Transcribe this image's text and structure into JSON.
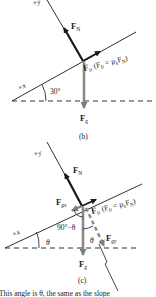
{
  "diagram_b": {
    "axis_y_label": "+y",
    "axis_x_label": "+x",
    "angle_label": "30°",
    "normal_force": {
      "symbol": "F",
      "sub": "N"
    },
    "friction_force": {
      "symbol": "F",
      "sub": "fr",
      "equation_open": "(F",
      "equation_sub": "fr",
      "equation_mid": " = μ",
      "equation_sub2": "k",
      "equation_F": "F",
      "equation_sub3": "N",
      "equation_close": ")"
    },
    "gravity_force": {
      "symbol": "F",
      "sub": "g"
    },
    "caption": "(b)"
  },
  "diagram_c": {
    "axis_y_label": "+y",
    "axis_x_label": "+x",
    "angle_incline_label": "θ",
    "angle_complement_label": "90°−θ",
    "angle_between_label": "θ",
    "normal_force": {
      "symbol": "F",
      "sub": "N"
    },
    "gravity_x": {
      "symbol": "F",
      "sub": "gx"
    },
    "gravity_y": {
      "symbol": "F",
      "sub": "gy"
    },
    "friction_force": {
      "symbol": "F",
      "sub": "fr",
      "equation_open": "(F",
      "equation_sub": "fr",
      "equation_mid": " = μ",
      "equation_sub2": "k",
      "equation_F": "F",
      "equation_sub3": "N",
      "equation_close": ")"
    },
    "gravity_force": {
      "symbol": "F",
      "sub": "g"
    },
    "caption": "(c)",
    "annotation": "This angle is θ, the same as the slope"
  },
  "colors": {
    "line": "#1a1a1a",
    "gravity_arrow": "#8a8a8a",
    "dashed_component": "#8a8a8a"
  }
}
